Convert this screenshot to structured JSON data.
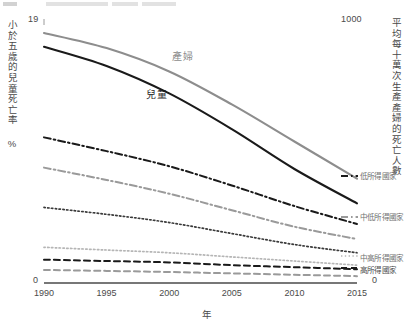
{
  "axes": {
    "left": {
      "title": "小於五歲的兒童死亡率 %",
      "max_label": "19",
      "min_label": "0"
    },
    "right": {
      "title": "平均每十萬次生產產婦的死亡人數",
      "max_label": "1000",
      "min_label": "0"
    },
    "x": {
      "title": "年",
      "ticks": [
        "1990",
        "1995",
        "2000",
        "2005",
        "2010",
        "2015"
      ]
    }
  },
  "annotations": {
    "maternal": "產婦",
    "child": "兒童"
  },
  "legend": {
    "low_income": "低所得國家",
    "lower_middle_income": "中低所得國家",
    "upper_middle_income": "中高所得國家",
    "high_income": "高所得國家"
  },
  "colors": {
    "maternal_line": "#8d8d8d",
    "child_line": "#1a1a1a",
    "axis": "#4a4a4a",
    "background": "#ffffff"
  },
  "chart_data": {
    "type": "line",
    "title": "",
    "xlabel": "年",
    "ylabel": "小於五歲的兒童死亡率 %",
    "y2label": "平均每十萬次生產產婦的死亡人數",
    "x": [
      1990,
      1995,
      2000,
      2005,
      2010,
      2015
    ],
    "xlim": [
      1990,
      2015
    ],
    "ylim": [
      0,
      19
    ],
    "y2lim": [
      0,
      1000
    ],
    "grid": false,
    "legend_position": "right",
    "series": [
      {
        "name": "產婦",
        "axis": "right",
        "style": "solid",
        "color": "#8d8d8d",
        "values": [
          18.2,
          17.1,
          15.4,
          13.0,
          10.3,
          7.6
        ]
      },
      {
        "name": "兒童",
        "axis": "left",
        "style": "solid",
        "color": "#1a1a1a",
        "values": [
          17.2,
          15.8,
          13.8,
          11.2,
          8.3,
          5.8
        ]
      },
      {
        "name": "低所得國家",
        "axis": "right",
        "style": "dash-dot",
        "color": "#1a1a1a",
        "values": [
          10.6,
          9.6,
          8.5,
          7.1,
          5.6,
          4.3
        ]
      },
      {
        "name": "中低所得國家",
        "axis": "right",
        "style": "dash-dot",
        "color": "#9a9a9a",
        "values": [
          8.4,
          7.5,
          6.5,
          5.3,
          4.1,
          3.2
        ]
      },
      {
        "name": "低所得國家兒童",
        "axis": "left",
        "style": "dotted",
        "color": "#3a3a3a",
        "values": [
          5.5,
          5.0,
          4.4,
          3.6,
          2.8,
          2.2
        ]
      },
      {
        "name": "中高所得國家",
        "axis": "left",
        "style": "dotted",
        "color": "#b5b5b5",
        "values": [
          2.6,
          2.4,
          2.2,
          1.9,
          1.6,
          1.3
        ]
      },
      {
        "name": "高所得國家",
        "axis": "right",
        "style": "dashed",
        "color": "#1a1a1a",
        "values": [
          1.7,
          1.6,
          1.5,
          1.3,
          1.15,
          1.0
        ]
      },
      {
        "name": "高所得國家兒童",
        "axis": "left",
        "style": "dashed",
        "color": "#9a9a9a",
        "values": [
          0.95,
          0.88,
          0.8,
          0.7,
          0.6,
          0.5
        ]
      }
    ]
  }
}
